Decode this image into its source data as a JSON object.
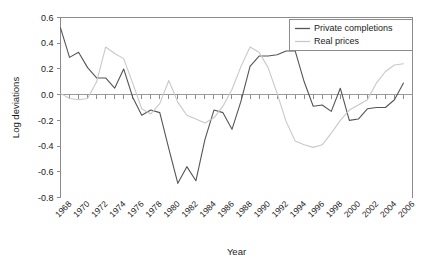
{
  "chart_data": {
    "type": "line",
    "title": "",
    "xlabel": "Year",
    "ylabel": "Log deviations",
    "xlim": [
      1967,
      2006
    ],
    "ylim": [
      -0.8,
      0.6
    ],
    "ytick_labels": [
      "0.6",
      "0.4",
      "0.2",
      "0.0",
      "-0.2",
      "-0.4",
      "-0.6",
      "-0.8"
    ],
    "ytick_values": [
      0.6,
      0.4,
      0.2,
      0.0,
      -0.2,
      -0.4,
      -0.6,
      -0.8
    ],
    "xtick_labels": [
      "1968",
      "1970",
      "1972",
      "1974",
      "1976",
      "1978",
      "1980",
      "1982",
      "1984",
      "1986",
      "1988",
      "1990",
      "1992",
      "1994",
      "1996",
      "1998",
      "2000",
      "2002",
      "2004",
      "2006"
    ],
    "xtick_values": [
      1968,
      1970,
      1972,
      1974,
      1976,
      1978,
      1980,
      1982,
      1984,
      1986,
      1988,
      1990,
      1992,
      1994,
      1996,
      1998,
      2000,
      2002,
      2004,
      2006
    ],
    "grid": false,
    "legend_position": "top-right",
    "x": [
      1967,
      1968,
      1969,
      1970,
      1971,
      1972,
      1973,
      1974,
      1975,
      1976,
      1977,
      1978,
      1979,
      1980,
      1981,
      1982,
      1983,
      1984,
      1985,
      1986,
      1987,
      1988,
      1989,
      1990,
      1991,
      1992,
      1993,
      1994,
      1995,
      1996,
      1997,
      1998,
      1999,
      2000,
      2001,
      2002,
      2003,
      2004,
      2005
    ],
    "series": [
      {
        "name": "Private completions",
        "color": "#555555",
        "values": [
          0.52,
          0.29,
          0.33,
          0.21,
          0.13,
          0.13,
          0.05,
          0.2,
          -0.02,
          -0.16,
          -0.12,
          -0.14,
          -0.42,
          -0.69,
          -0.56,
          -0.67,
          -0.35,
          -0.12,
          -0.14,
          -0.27,
          -0.05,
          0.22,
          0.3,
          0.3,
          0.31,
          0.34,
          0.34,
          0.1,
          -0.09,
          -0.08,
          -0.13,
          0.05,
          -0.2,
          -0.19,
          -0.11,
          -0.1,
          -0.1,
          -0.04,
          0.09
        ]
      },
      {
        "name": "Real prices",
        "color": "#c8c8c8",
        "values": [
          0.01,
          -0.03,
          -0.04,
          -0.03,
          0.1,
          0.37,
          0.32,
          0.28,
          0.09,
          -0.11,
          -0.15,
          -0.07,
          0.11,
          -0.06,
          -0.16,
          -0.19,
          -0.22,
          -0.18,
          -0.09,
          0.04,
          0.22,
          0.37,
          0.33,
          0.21,
          0.01,
          -0.21,
          -0.36,
          -0.39,
          -0.41,
          -0.39,
          -0.3,
          -0.2,
          -0.12,
          -0.08,
          -0.04,
          0.09,
          0.18,
          0.23,
          0.24
        ]
      }
    ],
    "series_tail": {
      "private_completions_end": [
        [
          2001,
          -0.1
        ],
        [
          2002,
          0.34
        ],
        [
          2003,
          0.25
        ],
        [
          2004,
          0.17
        ],
        [
          2005,
          0.03
        ]
      ],
      "real_prices_end": [
        [
          2001,
          0.23
        ],
        [
          2002,
          0.24
        ],
        [
          2003,
          0.22
        ],
        [
          2004,
          0.26
        ],
        [
          2005,
          0.31
        ]
      ]
    }
  },
  "legend": {
    "items": [
      {
        "label": "Private completions",
        "color": "#555555"
      },
      {
        "label": "Real prices",
        "color": "#c8c8c8"
      }
    ]
  }
}
